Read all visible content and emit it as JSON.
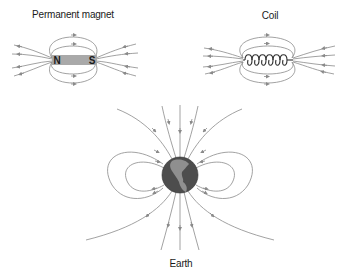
{
  "diagram": {
    "panels": [
      {
        "id": "magnet",
        "title": "Permanent magnet",
        "pole_north": "N",
        "pole_south": "S"
      },
      {
        "id": "coil",
        "title": "Coil"
      },
      {
        "id": "earth",
        "title": "Earth"
      }
    ]
  },
  "colors": {
    "field_line": "#8a8a8a",
    "arrow": "#8a8a8a",
    "magnet_bar": "#a9a9a9",
    "coil_wire": "#3a3a3a",
    "earth_ocean": "#4d4d4d",
    "earth_land": "#8f8f8f",
    "text": "#1a1a1a"
  }
}
